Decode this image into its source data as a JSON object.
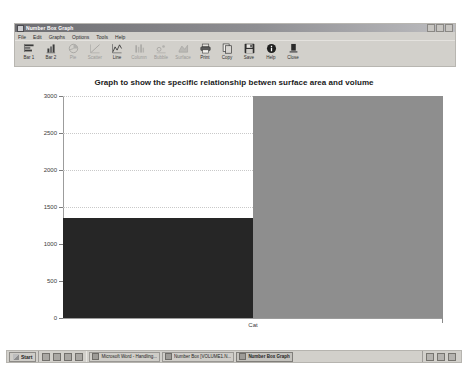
{
  "window": {
    "title": "Number Box Graph",
    "icon": "app-window-icon",
    "controls": [
      "minimize-button",
      "maximize-button",
      "close-button"
    ],
    "menu": [
      {
        "label": "File"
      },
      {
        "label": "Edit"
      },
      {
        "label": "Graphs"
      },
      {
        "label": "Options"
      },
      {
        "label": "Tools"
      },
      {
        "label": "Help"
      }
    ],
    "toolbar": [
      {
        "label": "Bar 1",
        "icon": "bar1-icon",
        "enabled": true
      },
      {
        "label": "Bar 2",
        "icon": "bar2-icon",
        "enabled": true
      },
      {
        "label": "Pie",
        "icon": "pie-icon",
        "enabled": false
      },
      {
        "label": "Scatter",
        "icon": "scatter-icon",
        "enabled": false
      },
      {
        "label": "Line",
        "icon": "line-icon",
        "enabled": true
      },
      {
        "label": "Column",
        "icon": "column-icon",
        "enabled": false
      },
      {
        "label": "Bubble",
        "icon": "bubble-icon",
        "enabled": false
      },
      {
        "label": "Surface",
        "icon": "surface-icon",
        "enabled": false
      },
      {
        "label": "Print",
        "icon": "print-icon",
        "enabled": true
      },
      {
        "label": "Copy",
        "icon": "copy-icon",
        "enabled": true
      },
      {
        "label": "Save",
        "icon": "save-icon",
        "enabled": true
      },
      {
        "label": "Help",
        "icon": "help-icon",
        "enabled": true
      },
      {
        "label": "Close",
        "icon": "close-icon",
        "enabled": true
      }
    ]
  },
  "chart_data": {
    "type": "bar",
    "title": "Graph to show the specific relationship betwen surface area and volume",
    "xlabel": "Cat",
    "ylabel": "",
    "categories": [
      "Cat"
    ],
    "series": [
      {
        "name": "Surface area",
        "values": [
          1350
        ],
        "color": "#262626"
      },
      {
        "name": "Volume",
        "values": [
          3000
        ],
        "color": "#8e8e8e"
      }
    ],
    "yticks": [
      0,
      500,
      1000,
      1500,
      2000,
      2500,
      3000
    ],
    "ytick_labels": [
      "0",
      "500",
      "1000",
      "1500",
      "2000",
      "2500",
      "3000"
    ],
    "ylim": [
      0,
      3000
    ],
    "grid": true,
    "legend": "none"
  },
  "taskbar": {
    "start_label": "Start",
    "quick_launch": [
      "show-desktop-icon",
      "internet-explorer-icon",
      "outlook-icon",
      "media-player-icon"
    ],
    "tasks": [
      {
        "label": "Microsoft Word - Handling...",
        "active": false
      },
      {
        "label": "Number Box [VOLUME1.N...",
        "active": false
      },
      {
        "label": "Number Box Graph",
        "active": true
      }
    ],
    "tray": [
      "volume-icon",
      "network-icon",
      "language-icon"
    ]
  }
}
